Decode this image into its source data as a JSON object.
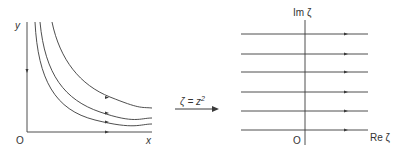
{
  "left_panel": {
    "y_axis_label": "y",
    "x_axis_label": "x",
    "origin_label": "O",
    "description": "z-plane: hyperbolic streamlines xy = const with flow arrows"
  },
  "mapping": {
    "label_lhs": "ζ = z",
    "label_exp": "2",
    "arrow": "right-arrow"
  },
  "right_panel": {
    "im_axis_label": "Im ζ",
    "re_axis_label": "Re ζ",
    "origin_label": "O",
    "description": "ζ-plane: uniform horizontal streamlines with flow arrows",
    "line_count": 6
  },
  "colors": {
    "line": "#3a3a3a",
    "text": "#333333",
    "background": "#ffffff"
  }
}
